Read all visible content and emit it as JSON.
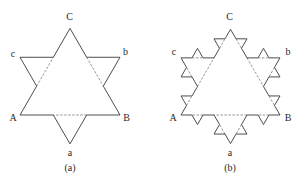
{
  "figures": [
    {
      "id": "a",
      "caption": "(a)",
      "iteration": 1,
      "triangle": {
        "A": [
          20,
          115
        ],
        "B": [
          120,
          115
        ],
        "C": [
          70,
          28.4
        ]
      },
      "labels": {
        "C": {
          "text": "C",
          "pos": [
            69.5,
            17
          ]
        },
        "c": {
          "text": "c",
          "pos": [
            13,
            54
          ]
        },
        "b": {
          "text": "b",
          "pos": [
            125.5,
            52
          ]
        },
        "A": {
          "text": "A",
          "pos": [
            13,
            118
          ]
        },
        "B": {
          "text": "B",
          "pos": [
            126.5,
            118
          ]
        },
        "a": {
          "text": "a",
          "pos": [
            70,
            152.5
          ]
        },
        "caption": {
          "text": "(a)",
          "pos": [
            70,
            167.5
          ]
        }
      }
    },
    {
      "id": "b",
      "caption": "(b)",
      "iteration": 2,
      "triangle": {
        "A": [
          181,
          115
        ],
        "B": [
          280,
          115
        ],
        "C": [
          230.5,
          29.3
        ]
      },
      "labels": {
        "C": {
          "text": "C",
          "pos": [
            229.5,
            17
          ]
        },
        "c": {
          "text": "c",
          "pos": [
            174,
            52
          ]
        },
        "b": {
          "text": "b",
          "pos": [
            288,
            52
          ]
        },
        "A": {
          "text": "A",
          "pos": [
            173,
            118
          ]
        },
        "B": {
          "text": "B",
          "pos": [
            288,
            118
          ]
        },
        "a": {
          "text": "a",
          "pos": [
            230,
            152.5
          ]
        },
        "caption": {
          "text": "(b)",
          "pos": [
            230,
            167.5
          ]
        }
      }
    }
  ],
  "style": {
    "stroke": "#3a3a3a",
    "dashed_stroke": "#6a6a6a",
    "label_color": "#2a2a2a"
  }
}
